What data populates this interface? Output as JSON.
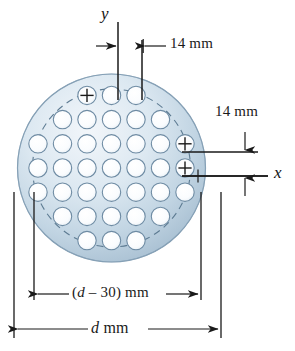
{
  "figure": {
    "canvas": {
      "width": 295,
      "height": 351
    }
  },
  "labels": {
    "y_axis": "y",
    "x_axis": "x",
    "top_dim": "14 mm",
    "right_dim": "14 mm",
    "inner_dim_prefix": "(",
    "inner_dim": "d – 30) mm",
    "inner_dim_italic": "d",
    "inner_dim_rest": " – 30) mm",
    "outer_dim_italic": "d",
    "outer_dim_rest": " mm"
  },
  "colors": {
    "plate_fill_light": "#eef3f7",
    "plate_fill_mid": "#c7d7e4",
    "plate_fill_dark": "#9fb8cc",
    "plate_edge": "#7e9ab0",
    "hole_edge": "#6e8ba3",
    "hole_fill": "#fbfdfe",
    "bolt_circle_dash": "#5d7b92",
    "line": "#1a1a1a",
    "background": "#ffffff"
  },
  "geometry": {
    "plate_center_x": 111.5,
    "plate_center_y": 168,
    "plate_radius": 94,
    "bolt_circle_radius": 79,
    "hole_radius": 9.2,
    "pitch_x": 24.5,
    "pitch_y": 24.2
  },
  "hole_grid": {
    "description": "Staggered rows of holes, symmetric top-to-bottom",
    "row_counts": [
      3,
      5,
      7,
      7,
      7,
      5,
      3
    ],
    "total_holes": 37,
    "marked_holes": [
      {
        "row": 0,
        "index": 1,
        "mark": "plus"
      },
      {
        "row": 0,
        "index": 2,
        "mark": "plus"
      },
      {
        "row": 2,
        "index": 6,
        "mark": "plus"
      },
      {
        "row": 3,
        "index": 6,
        "mark": "plus"
      }
    ]
  },
  "dimensions": [
    {
      "name": "hole-pitch-horizontal",
      "value": "14 mm",
      "orientation": "horizontal",
      "position": "top"
    },
    {
      "name": "hole-pitch-vertical",
      "value": "14 mm",
      "orientation": "vertical",
      "position": "right"
    },
    {
      "name": "bolt-circle-diameter",
      "value": "(d – 30) mm",
      "orientation": "horizontal",
      "position": "bottom-inner"
    },
    {
      "name": "plate-diameter",
      "value": "d mm",
      "orientation": "horizontal",
      "position": "bottom-outer"
    }
  ]
}
